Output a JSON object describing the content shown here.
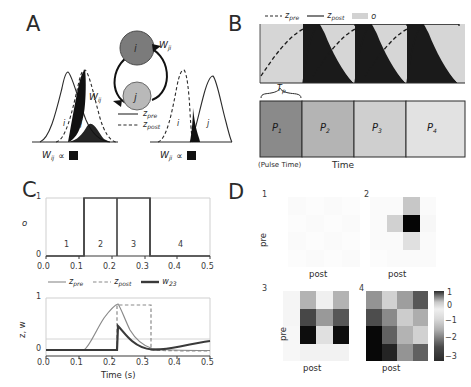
{
  "figure": {
    "panels": [
      "A",
      "B",
      "C",
      "D"
    ]
  },
  "panelA": {
    "letter": "A",
    "nodes": [
      {
        "id": "i",
        "label": "i",
        "color": "#808080"
      },
      {
        "id": "j",
        "label": "j",
        "color": "#b0b0b0"
      }
    ],
    "edges": [
      {
        "label": "W",
        "sub": "ji"
      },
      {
        "label": "W",
        "sub": "ij"
      }
    ],
    "trace_labels_left": [
      "i",
      "j"
    ],
    "trace_labels_right": [
      "i",
      "j"
    ],
    "legend": [
      {
        "name": "z",
        "sub": "pre",
        "style": "solid"
      },
      {
        "name": "z",
        "sub": "post",
        "style": "dashed"
      }
    ],
    "caption_left": {
      "w": "W",
      "sub": "ij",
      "prop": "∝"
    },
    "caption_right": {
      "w": "W",
      "sub": "ji",
      "prop": "∝"
    }
  },
  "panelB": {
    "letter": "B",
    "legend": [
      {
        "name": "z",
        "sub": "pre",
        "style": "dashed"
      },
      {
        "name": "z",
        "sub": "post",
        "style": "solid"
      },
      {
        "name": "o",
        "sub": "",
        "style": "patch"
      }
    ],
    "bracket_label": {
      "base": "T",
      "sub": "p"
    },
    "pulses": [
      {
        "label": "P",
        "sub": "1",
        "color": "#8a8a8a"
      },
      {
        "label": "P",
        "sub": "2",
        "color": "#b4b4b4"
      },
      {
        "label": "P",
        "sub": "3",
        "color": "#cfcfcf"
      },
      {
        "label": "P",
        "sub": "4",
        "color": "#e2e2e2"
      }
    ],
    "xlabel_left": "(Pulse Time)",
    "xlabel_center": "Time",
    "shade_color": "#d2d2d2",
    "fill_color": "#1a1a1a"
  },
  "panelC": {
    "letter": "C",
    "top": {
      "ylabel": "o",
      "yticks": [
        "0",
        "1"
      ],
      "xticks": [
        "0.0",
        "0.1",
        "0.2",
        "0.3",
        "0.4",
        "0.5"
      ],
      "pulse_numbers": [
        "1",
        "2",
        "3",
        "4"
      ],
      "pulse_number_x": [
        0.06,
        0.165,
        0.265,
        0.41
      ],
      "on_intervals": [
        [
          0.117,
          0.218
        ],
        [
          0.218,
          0.317
        ]
      ]
    },
    "bottom": {
      "ylabel": "z, w",
      "yticks": [
        "0",
        "1"
      ],
      "xticks": [
        "0.0",
        "0.1",
        "0.2",
        "0.3",
        "0.4",
        "0.5"
      ],
      "xlabel": "Time (s)",
      "legend": [
        {
          "name": "z",
          "sub": "pre",
          "style": "thin-solid"
        },
        {
          "name": "z",
          "sub": "post",
          "style": "dashed"
        },
        {
          "name": "w",
          "sub": "23",
          "style": "thick-solid"
        }
      ]
    }
  },
  "panelD": {
    "letter": "D",
    "matrices": [
      {
        "index": "1",
        "ylabel": "pre",
        "xlabel": "post",
        "values": [
          [
            0.02,
            0.01,
            0.02,
            0.01
          ],
          [
            0.01,
            0.02,
            0.01,
            0.02
          ],
          [
            0.02,
            0.01,
            0.02,
            0.01
          ],
          [
            0.01,
            0.02,
            0.01,
            0.02
          ]
        ]
      },
      {
        "index": "2",
        "ylabel": "",
        "xlabel": "post",
        "values": [
          [
            0.02,
            0.02,
            0.22,
            0.02
          ],
          [
            0.02,
            0.18,
            0.98,
            0.03
          ],
          [
            0.02,
            0.02,
            0.12,
            0.02
          ],
          [
            0.01,
            0.02,
            0.02,
            0.02
          ]
        ]
      },
      {
        "index": "3",
        "ylabel": "pre",
        "xlabel": "post",
        "values": [
          [
            0.04,
            0.3,
            0.06,
            0.3
          ],
          [
            0.04,
            0.72,
            0.4,
            0.66
          ],
          [
            0.03,
            0.95,
            0.12,
            0.95
          ],
          [
            0.03,
            0.05,
            0.05,
            0.05
          ]
        ]
      },
      {
        "index": "4",
        "ylabel": "",
        "xlabel": "post",
        "values": [
          [
            0.42,
            0.18,
            0.38,
            0.66
          ],
          [
            0.7,
            0.46,
            0.2,
            0.32
          ],
          [
            0.97,
            0.62,
            0.3,
            0.18
          ],
          [
            0.97,
            0.86,
            0.42,
            0.62
          ]
        ]
      }
    ],
    "colorbar": {
      "ticks": [
        "1",
        "0",
        "−1",
        "−2",
        "−3"
      ],
      "tick_positions": [
        0.0,
        0.18,
        0.4,
        0.64,
        0.95
      ]
    }
  },
  "chart_data": {
    "type": "line",
    "title": "",
    "panels": [
      {
        "id": "A",
        "type": "line",
        "description": "Pre/post synaptic traces for node pair i-j, two orderings",
        "series": [
          {
            "name": "z_pre",
            "style": "solid"
          },
          {
            "name": "z_post",
            "style": "dashed"
          }
        ],
        "left_group": {
          "order": [
            "i",
            "j"
          ],
          "weight": "W_ij"
        },
        "right_group": {
          "order": [
            "i",
            "j"
          ],
          "weight": "W_ji"
        }
      },
      {
        "id": "B",
        "type": "line",
        "description": "Repeated pulses P1..P4 with z_pre (dashed) rising and z_post (solid) decaying; overlap shaded black",
        "series": [
          {
            "name": "z_pre",
            "style": "dashed"
          },
          {
            "name": "z_post",
            "style": "solid"
          },
          {
            "name": "o",
            "style": "patch"
          }
        ],
        "categories": [
          "P_1",
          "P_2",
          "P_3",
          "P_4"
        ],
        "pulse_shades": [
          0.54,
          0.7,
          0.81,
          0.89
        ],
        "xlabel": "Time",
        "annotation": "T_p (Pulse Time)"
      },
      {
        "id": "C-top",
        "type": "line",
        "xlabel": "",
        "ylabel": "o",
        "xlim": [
          0.0,
          0.5
        ],
        "ylim": [
          0,
          1
        ],
        "xticks": [
          0.0,
          0.1,
          0.2,
          0.3,
          0.4,
          0.5
        ],
        "yticks": [
          0,
          1
        ],
        "grid": true,
        "series": [
          {
            "name": "o",
            "x": [
              0.0,
              0.117,
              0.117,
              0.218,
              0.218,
              0.317,
              0.317,
              0.5
            ],
            "y": [
              0,
              0,
              1,
              1,
              1,
              1,
              0,
              0
            ]
          }
        ],
        "annotations": [
          {
            "text": "1",
            "x": 0.06,
            "y": 0.12
          },
          {
            "text": "2",
            "x": 0.165,
            "y": 0.12
          },
          {
            "text": "3",
            "x": 0.265,
            "y": 0.12
          },
          {
            "text": "4",
            "x": 0.41,
            "y": 0.12
          }
        ]
      },
      {
        "id": "C-bottom",
        "type": "line",
        "xlabel": "Time (s)",
        "ylabel": "z, w",
        "xlim": [
          0.0,
          0.5
        ],
        "ylim": [
          -0.08,
          1.05
        ],
        "xticks": [
          0.0,
          0.1,
          0.2,
          0.3,
          0.4,
          0.5
        ],
        "yticks": [
          0,
          1
        ],
        "grid": true,
        "series": [
          {
            "name": "z_pre",
            "style": "thin-solid",
            "x": [
              0.0,
              0.117,
              0.14,
              0.165,
              0.19,
              0.215,
              0.219,
              0.24,
              0.27,
              0.3,
              0.33,
              0.37,
              0.42,
              0.5
            ],
            "y": [
              0.0,
              0.0,
              0.4,
              0.64,
              0.8,
              0.9,
              0.88,
              0.62,
              0.36,
              0.18,
              0.09,
              0.045,
              0.02,
              0.01
            ]
          },
          {
            "name": "z_post",
            "style": "dashed",
            "x": [
              0.0,
              0.218,
              0.222,
              0.245,
              0.318,
              0.322,
              0.33,
              0.36,
              0.4,
              0.45,
              0.5
            ],
            "y": [
              0.0,
              0.0,
              0.72,
              0.92,
              0.92,
              0.28,
              0.1,
              0.03,
              0.015,
              0.01,
              0.01
            ]
          },
          {
            "name": "w_23",
            "style": "thick-solid",
            "x": [
              0.0,
              0.215,
              0.219,
              0.235,
              0.26,
              0.29,
              0.315,
              0.34,
              0.36,
              0.4,
              0.45,
              0.5
            ],
            "y": [
              0.0,
              0.0,
              0.5,
              0.44,
              0.33,
              0.21,
              0.12,
              0.06,
              0.055,
              0.085,
              0.13,
              0.17
            ]
          }
        ]
      },
      {
        "id": "D",
        "type": "heatmap",
        "description": "Four 4x4 weight matrices (pre x post) at successive pulses",
        "xlabel": "post",
        "ylabel": "pre",
        "colorbar_ticks": [
          1,
          0,
          -1,
          -2,
          -3
        ],
        "colormap": "gray-reversed",
        "matrices": [
          {
            "index": 1,
            "values": [
              [
                1.0,
                1.0,
                1.0,
                1.0
              ],
              [
                1.0,
                1.0,
                1.0,
                1.0
              ],
              [
                1.0,
                1.0,
                1.0,
                1.0
              ],
              [
                1.0,
                1.0,
                1.0,
                1.0
              ]
            ]
          },
          {
            "index": 2,
            "values": [
              [
                1.0,
                1.0,
                0.1,
                1.0
              ],
              [
                1.0,
                0.3,
                -2.8,
                0.9
              ],
              [
                1.0,
                1.0,
                0.5,
                1.0
              ],
              [
                1.0,
                1.0,
                1.0,
                1.0
              ]
            ]
          },
          {
            "index": 3,
            "values": [
              [
                0.8,
                -0.2,
                0.7,
                -0.2
              ],
              [
                0.8,
                -1.8,
                -0.5,
                -1.6
              ],
              [
                0.9,
                -2.7,
                0.4,
                -2.7
              ],
              [
                0.9,
                0.8,
                0.8,
                0.8
              ]
            ]
          },
          {
            "index": 4,
            "values": [
              [
                -0.6,
                0.3,
                -0.4,
                -1.6
              ],
              [
                -1.7,
                -0.8,
                0.2,
                -0.1
              ],
              [
                -2.8,
                -1.4,
                -0.2,
                0.3
              ],
              [
                -2.8,
                -2.3,
                -0.6,
                -1.4
              ]
            ]
          }
        ]
      }
    ]
  }
}
